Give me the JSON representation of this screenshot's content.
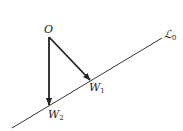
{
  "diagram": {
    "origin_label": "O",
    "line_label": "ℒ",
    "line_label_sub": "0",
    "points": [
      {
        "label": "W",
        "sub": "1"
      },
      {
        "label": "W",
        "sub": "2"
      }
    ],
    "colors": {
      "stroke": "#222222",
      "line": "#333333"
    }
  }
}
